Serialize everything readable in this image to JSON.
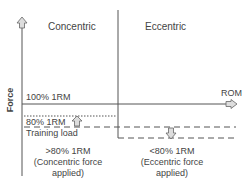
{
  "diagram": {
    "y_axis_label": "Force",
    "x_axis_label": "ROM",
    "regions": {
      "left": {
        "title": "Concentric"
      },
      "right": {
        "title": "Eccentric"
      }
    },
    "levels": {
      "max": "100% 1RM",
      "submax": "80% 1RM",
      "training_load": "Training load"
    },
    "captions": {
      "left": {
        "line1": ">80% 1RM",
        "line2": "(Concentric force",
        "line3": "applied)"
      },
      "right": {
        "line1": "<80% 1RM",
        "line2": "(Eccentric force",
        "line3": "applied)"
      }
    },
    "colors": {
      "line": "#555555",
      "arrow_fill": "#dddddd"
    }
  }
}
